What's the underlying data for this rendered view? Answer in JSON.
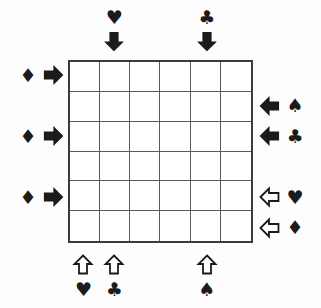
{
  "puzzle": {
    "title": "Card suit arrow grid puzzle",
    "grid": {
      "columns": 6,
      "rows": 6,
      "cells": [
        [
          "",
          "",
          "",
          "",
          "",
          ""
        ],
        [
          "",
          "",
          "",
          "",
          "",
          ""
        ],
        [
          "",
          "",
          "",
          "",
          "",
          ""
        ],
        [
          "",
          "",
          "",
          "",
          "",
          ""
        ],
        [
          "",
          "",
          "",
          "",
          "",
          ""
        ],
        [
          "",
          "",
          "",
          "",
          "",
          ""
        ]
      ],
      "border_color": "#3b3b3b",
      "line_color": "#5a5a5a",
      "cell_fill": "#ffffff"
    },
    "symbol_color": "#1b1b1b",
    "background_color": "#fdfdfd",
    "clues": {
      "top": [
        {
          "column": 2,
          "suit": "heart",
          "suit_glyph": "♥",
          "arrow": "down",
          "arrow_style": "filled"
        },
        {
          "column": 5,
          "suit": "club",
          "suit_glyph": "♣",
          "arrow": "down",
          "arrow_style": "filled"
        }
      ],
      "left": [
        {
          "row": 1,
          "suit": "diamond",
          "suit_glyph": "♦",
          "arrow": "right",
          "arrow_style": "filled"
        },
        {
          "row": 3,
          "suit": "diamond",
          "suit_glyph": "♦",
          "arrow": "right",
          "arrow_style": "filled"
        },
        {
          "row": 5,
          "suit": "diamond",
          "suit_glyph": "♦",
          "arrow": "right",
          "arrow_style": "filled"
        }
      ],
      "right": [
        {
          "row": 2,
          "suit": "spade",
          "suit_glyph": "♠",
          "arrow": "left",
          "arrow_style": "filled"
        },
        {
          "row": 3,
          "suit": "club",
          "suit_glyph": "♣",
          "arrow": "left",
          "arrow_style": "filled"
        },
        {
          "row": 5,
          "suit": "heart",
          "suit_glyph": "♥",
          "arrow": "left",
          "arrow_style": "hollow"
        },
        {
          "row": 6,
          "suit": "diamond",
          "suit_glyph": "♦",
          "arrow": "left",
          "arrow_style": "hollow"
        }
      ],
      "bottom": [
        {
          "column": 1,
          "suit": "heart",
          "suit_glyph": "♥",
          "arrow": "up",
          "arrow_style": "hollow"
        },
        {
          "column": 2,
          "suit": "club",
          "suit_glyph": "♣",
          "arrow": "up",
          "arrow_style": "hollow"
        },
        {
          "column": 5,
          "suit": "spade",
          "suit_glyph": "♠",
          "arrow": "up",
          "arrow_style": "hollow"
        }
      ]
    }
  }
}
